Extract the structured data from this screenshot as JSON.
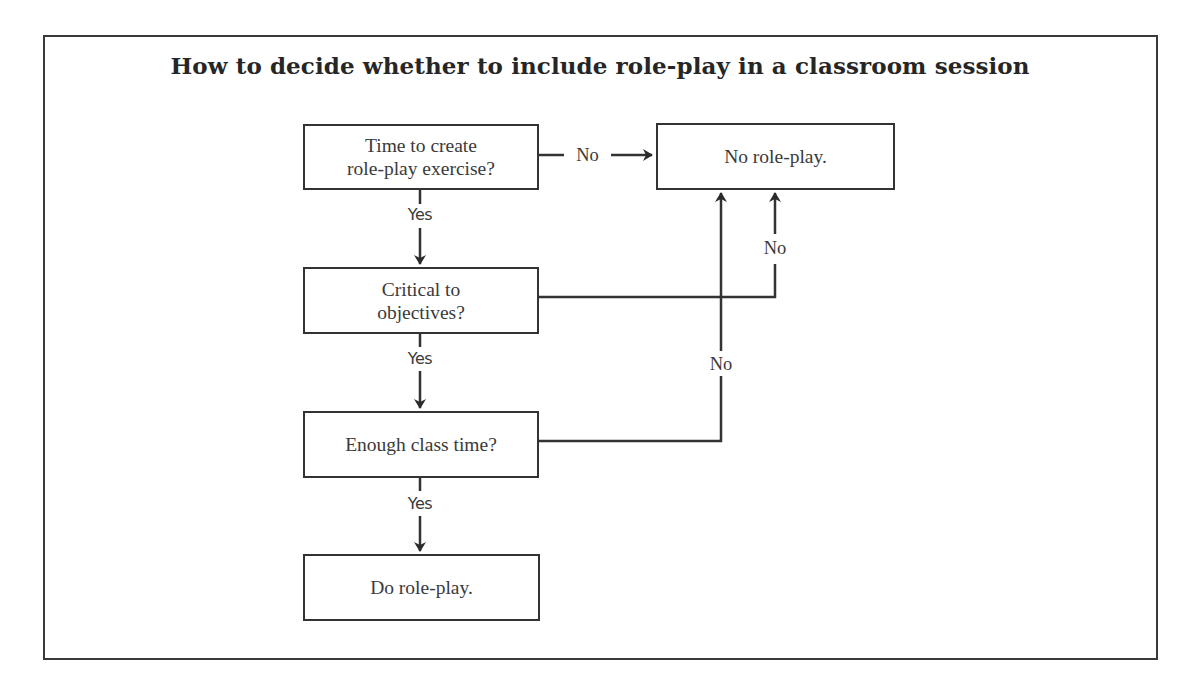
{
  "diagram": {
    "title": "How to decide whether to include role-play in a classroom session",
    "nodes": [
      {
        "id": "time-to-create",
        "type": "decision",
        "lines": [
          "Time to create",
          "role-play exercise?"
        ]
      },
      {
        "id": "critical",
        "type": "decision",
        "lines": [
          "Critical to",
          "objectives?"
        ]
      },
      {
        "id": "class-time",
        "type": "decision",
        "lines": [
          "Enough class time?"
        ]
      },
      {
        "id": "do-roleplay",
        "type": "outcome",
        "lines": [
          "Do role-play."
        ]
      },
      {
        "id": "no-roleplay",
        "type": "outcome",
        "lines": [
          "No role-play."
        ]
      }
    ],
    "edges": [
      {
        "from": "time-to-create",
        "to": "no-roleplay",
        "label": "No"
      },
      {
        "from": "time-to-create",
        "to": "critical",
        "label": "Yes"
      },
      {
        "from": "critical",
        "to": "no-roleplay",
        "label": "No"
      },
      {
        "from": "critical",
        "to": "class-time",
        "label": "Yes"
      },
      {
        "from": "class-time",
        "to": "no-roleplay",
        "label": "No"
      },
      {
        "from": "class-time",
        "to": "do-roleplay",
        "label": "Yes"
      }
    ],
    "colors": {
      "line": "#333333",
      "text": "#3a3a3a",
      "background": "#ffffff"
    }
  }
}
